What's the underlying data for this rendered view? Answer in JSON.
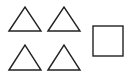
{
  "diagram": {
    "stroke_color": "#222222",
    "background": "#ffffff",
    "shapes": [
      {
        "type": "triangle",
        "label": "triangle-1",
        "points": "9,31 25,7 41,31"
      },
      {
        "type": "triangle",
        "label": "triangle-2",
        "points": "48,31 64,7 80,31"
      },
      {
        "type": "triangle",
        "label": "triangle-3",
        "points": "9,70 25,45 41,70"
      },
      {
        "type": "triangle",
        "label": "triangle-4",
        "points": "48,70 64,45 80,70"
      },
      {
        "type": "square",
        "label": "square-1",
        "x": 93,
        "y": 26,
        "w": 30,
        "h": 30
      }
    ],
    "counts": {
      "triangles": 4,
      "squares": 1
    }
  }
}
